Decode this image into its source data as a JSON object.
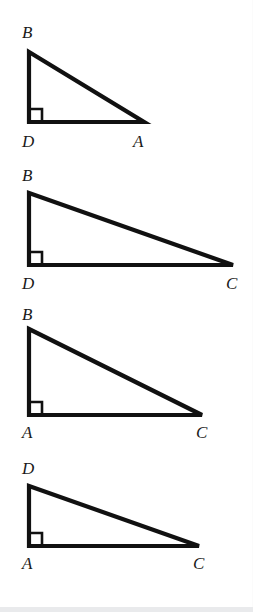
{
  "page": {
    "background_color": "#ffffff",
    "stroke_color": "#111111",
    "label_color": "#1a1a1a",
    "width": 253,
    "height": 612,
    "bottom_strip_color": "#e9eaec"
  },
  "figures": [
    {
      "id": "figure-1",
      "name": "triangle-BDA",
      "right_angle_vertex": "D",
      "labels": {
        "apex": "B",
        "origin": "D",
        "far": "A"
      },
      "label_positions": {
        "apex": {
          "x": 22,
          "y": 38
        },
        "origin": {
          "x": 22,
          "y": 147
        },
        "far": {
          "x": 133,
          "y": 147
        }
      },
      "points": {
        "apex": {
          "x": 29,
          "y": 52
        },
        "origin": {
          "x": 29,
          "y": 122
        },
        "far": {
          "x": 144,
          "y": 122
        }
      },
      "right_angle_mark": {
        "x": 29,
        "y": 122,
        "size": 13
      },
      "block_top": 0,
      "block_height": 158
    },
    {
      "id": "figure-2",
      "name": "triangle-BDC",
      "right_angle_vertex": "D",
      "labels": {
        "apex": "B",
        "origin": "D",
        "far": "C"
      },
      "label_positions": {
        "apex": {
          "x": 22,
          "y": 181
        },
        "origin": {
          "x": 22,
          "y": 289
        },
        "far": {
          "x": 226,
          "y": 289
        }
      },
      "points": {
        "apex": {
          "x": 29,
          "y": 193
        },
        "origin": {
          "x": 29,
          "y": 265
        },
        "far": {
          "x": 233,
          "y": 265
        }
      },
      "right_angle_mark": {
        "x": 29,
        "y": 265,
        "size": 13
      },
      "block_top": 158,
      "block_height": 140
    },
    {
      "id": "figure-3",
      "name": "triangle-BAC",
      "right_angle_vertex": "A",
      "labels": {
        "apex": "B",
        "origin": "A",
        "far": "C"
      },
      "label_positions": {
        "apex": {
          "x": 22,
          "y": 320
        },
        "origin": {
          "x": 22,
          "y": 438
        },
        "far": {
          "x": 196,
          "y": 438
        }
      },
      "points": {
        "apex": {
          "x": 29,
          "y": 329
        },
        "origin": {
          "x": 29,
          "y": 415
        },
        "far": {
          "x": 202,
          "y": 415
        }
      },
      "right_angle_mark": {
        "x": 29,
        "y": 415,
        "size": 13
      },
      "block_top": 298,
      "block_height": 152
    },
    {
      "id": "figure-4",
      "name": "triangle-DAC",
      "right_angle_vertex": "A",
      "labels": {
        "apex": "D",
        "origin": "A",
        "far": "C"
      },
      "label_positions": {
        "apex": {
          "x": 22,
          "y": 474
        },
        "origin": {
          "x": 22,
          "y": 569
        },
        "far": {
          "x": 193,
          "y": 569
        }
      },
      "points": {
        "apex": {
          "x": 29,
          "y": 486
        },
        "origin": {
          "x": 29,
          "y": 546
        },
        "far": {
          "x": 199,
          "y": 546
        }
      },
      "right_angle_mark": {
        "x": 29,
        "y": 546,
        "size": 13
      },
      "block_top": 450,
      "block_height": 162
    }
  ]
}
